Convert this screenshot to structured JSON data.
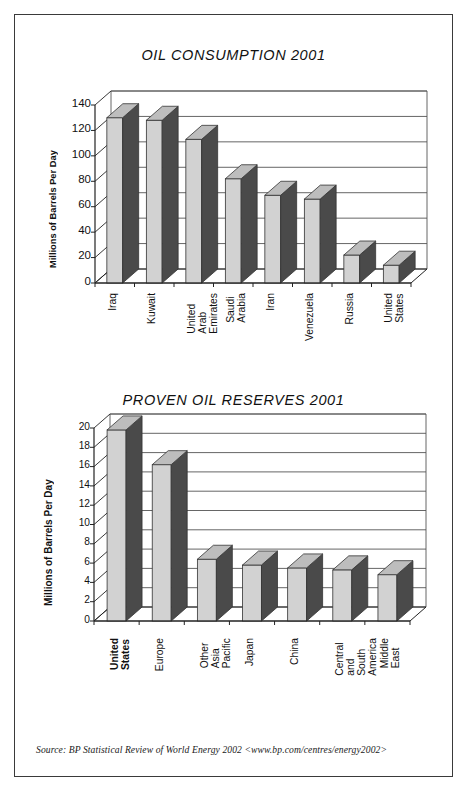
{
  "figure": {
    "source_note": "Source: BP Statistical Review of World Energy 2002 <www.bp.com/centres/energy2002>"
  },
  "chart_data": [
    {
      "type": "bar",
      "title": "OIL CONSUMPTION 2001",
      "xlabel": "",
      "ylabel": "Millions of Barrels Per Day",
      "categories": [
        "Iraq",
        "Kuwait",
        "United Arab\nEmirates",
        "Saudi Arabia",
        "Iran",
        "Venezuela",
        "Russia",
        "United States"
      ],
      "values": [
        130,
        128,
        113,
        82,
        69,
        66,
        22,
        14
      ],
      "ylim": [
        0,
        140
      ],
      "yticks": [
        0,
        20,
        40,
        60,
        80,
        100,
        120,
        140
      ],
      "grid": true,
      "legend": "none",
      "style": "3d-column"
    },
    {
      "type": "bar",
      "title": "PROVEN OIL RESERVES 2001",
      "xlabel": "",
      "ylabel": "Millions of Barrels Per Day",
      "categories": [
        "United States",
        "Europe",
        "Other Asia\nPacific",
        "Japan",
        "China",
        "Central and\nSouth America",
        "Middle East"
      ],
      "values": [
        19.8,
        16.2,
        6.4,
        5.8,
        5.5,
        5.3,
        4.8
      ],
      "ylim": [
        0,
        20
      ],
      "yticks": [
        0,
        2,
        4,
        6,
        8,
        10,
        12,
        14,
        16,
        18,
        20
      ],
      "grid": true,
      "legend": "none",
      "style": "3d-column",
      "bold_categories": [
        "United States"
      ]
    }
  ],
  "colors": {
    "bar_front": "#d2d2d2",
    "bar_side": "#4a4a4a",
    "bar_top": "#bdbdbd",
    "axis": "#222222",
    "grid": "#555555",
    "frame": "#3a3a3a",
    "text": "#111111"
  }
}
